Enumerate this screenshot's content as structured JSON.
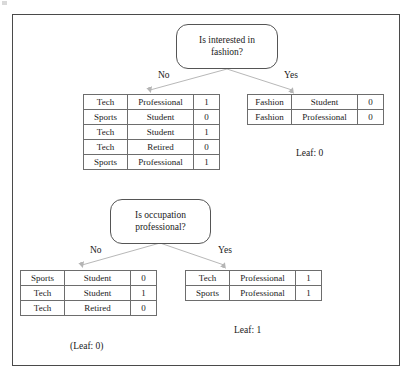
{
  "figure": {
    "frame_color": "#4a4a4a",
    "line_color": "#aaaaaa",
    "text_color": "#1a1a1a"
  },
  "nodes": {
    "root": {
      "text": "Is interested in\nfashion?",
      "line1": "Is interested in",
      "line2": "fashion?"
    },
    "second": {
      "text": "Is occupation\nprofessional?",
      "line1": "Is occupation",
      "line2": "professional?"
    }
  },
  "branches": {
    "root_no": "No",
    "root_yes": "Yes",
    "second_no": "No",
    "second_yes": "Yes"
  },
  "tables": {
    "root_no_table": {
      "columns": [
        "interest",
        "occupation",
        "label"
      ],
      "rows": [
        {
          "interest": "Tech",
          "occupation": "Professional",
          "label": "1"
        },
        {
          "interest": "Sports",
          "occupation": "Student",
          "label": "0"
        },
        {
          "interest": "Tech",
          "occupation": "Student",
          "label": "1"
        },
        {
          "interest": "Tech",
          "occupation": "Retired",
          "label": "0"
        },
        {
          "interest": "Sports",
          "occupation": "Professional",
          "label": "1"
        }
      ]
    },
    "root_yes_table": {
      "columns": [
        "interest",
        "occupation",
        "label"
      ],
      "rows": [
        {
          "interest": "Fashion",
          "occupation": "Student",
          "label": "0"
        },
        {
          "interest": "Fashion",
          "occupation": "Professional",
          "label": "0"
        }
      ]
    },
    "second_no_table": {
      "columns": [
        "interest",
        "occupation",
        "label"
      ],
      "rows": [
        {
          "interest": "Sports",
          "occupation": "Student",
          "label": "0"
        },
        {
          "interest": "Tech",
          "occupation": "Student",
          "label": "1"
        },
        {
          "interest": "Tech",
          "occupation": "Retired",
          "label": "0"
        }
      ]
    },
    "second_yes_table": {
      "columns": [
        "interest",
        "occupation",
        "label"
      ],
      "rows": [
        {
          "interest": "Tech",
          "occupation": "Professional",
          "label": "1"
        },
        {
          "interest": "Sports",
          "occupation": "Professional",
          "label": "1"
        }
      ]
    }
  },
  "leaves": {
    "root_yes_leaf": "Leaf: 0",
    "second_no_leaf": "(Leaf: 0)",
    "second_yes_leaf": "Leaf: 1"
  }
}
